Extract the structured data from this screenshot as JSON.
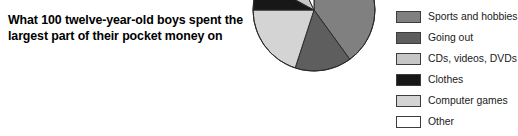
{
  "title": {
    "line1": "What 100 twelve-year-old boys spent the",
    "line2": "largest part of their pocket money on"
  },
  "legend": {
    "items": [
      {
        "label": "Sports and hobbies",
        "color": "#808080",
        "swatch_name": "legend-swatch-sports-and-hobbies"
      },
      {
        "label": "Going out",
        "color": "#5e5e5e",
        "swatch_name": "legend-swatch-going-out"
      },
      {
        "label": "CDs, videos, DVDs",
        "color": "#c6c6c6",
        "swatch_name": "legend-swatch-cds-videos-dvds"
      },
      {
        "label": "Clothes",
        "color": "#171717",
        "swatch_name": "legend-swatch-clothes"
      },
      {
        "label": "Computer games",
        "color": "#d4d4d4",
        "swatch_name": "legend-swatch-computer-games"
      },
      {
        "label": "Other",
        "color": "#ffffff",
        "swatch_name": "legend-swatch-other"
      }
    ]
  },
  "chart_data": {
    "type": "pie",
    "title": "What 100 twelve-year-old boys spent the largest part of their pocket money on",
    "xlabel": "",
    "ylabel": "",
    "units": "boys (out of 100)",
    "start_angle_deg": 0,
    "direction": "clockwise",
    "legend_position": "right",
    "grid": false,
    "categories": [
      "Sports and hobbies",
      "Going out",
      "Computer games",
      "Clothes",
      "CDs, videos, DVDs",
      "Other"
    ],
    "values": [
      40,
      15,
      20,
      8,
      10,
      7
    ],
    "slices": [
      {
        "label": "Sports and hobbies",
        "value": 40,
        "color": "#808080",
        "start_deg": 0,
        "end_deg": 144
      },
      {
        "label": "Going out",
        "value": 15,
        "color": "#5e5e5e",
        "start_deg": 144,
        "end_deg": 198
      },
      {
        "label": "Computer games",
        "value": 20,
        "color": "#d4d4d4",
        "start_deg": 198,
        "end_deg": 270
      },
      {
        "label": "Clothes",
        "value": 8,
        "color": "#171717",
        "start_deg": 270,
        "end_deg": 298.8
      },
      {
        "label": "CDs, videos, DVDs",
        "value": 10,
        "color": "#c6c6c6",
        "start_deg": 298.8,
        "end_deg": 334.8
      },
      {
        "label": "Other",
        "value": 7,
        "color": "#ffffff",
        "start_deg": 334.8,
        "end_deg": 360
      }
    ]
  }
}
